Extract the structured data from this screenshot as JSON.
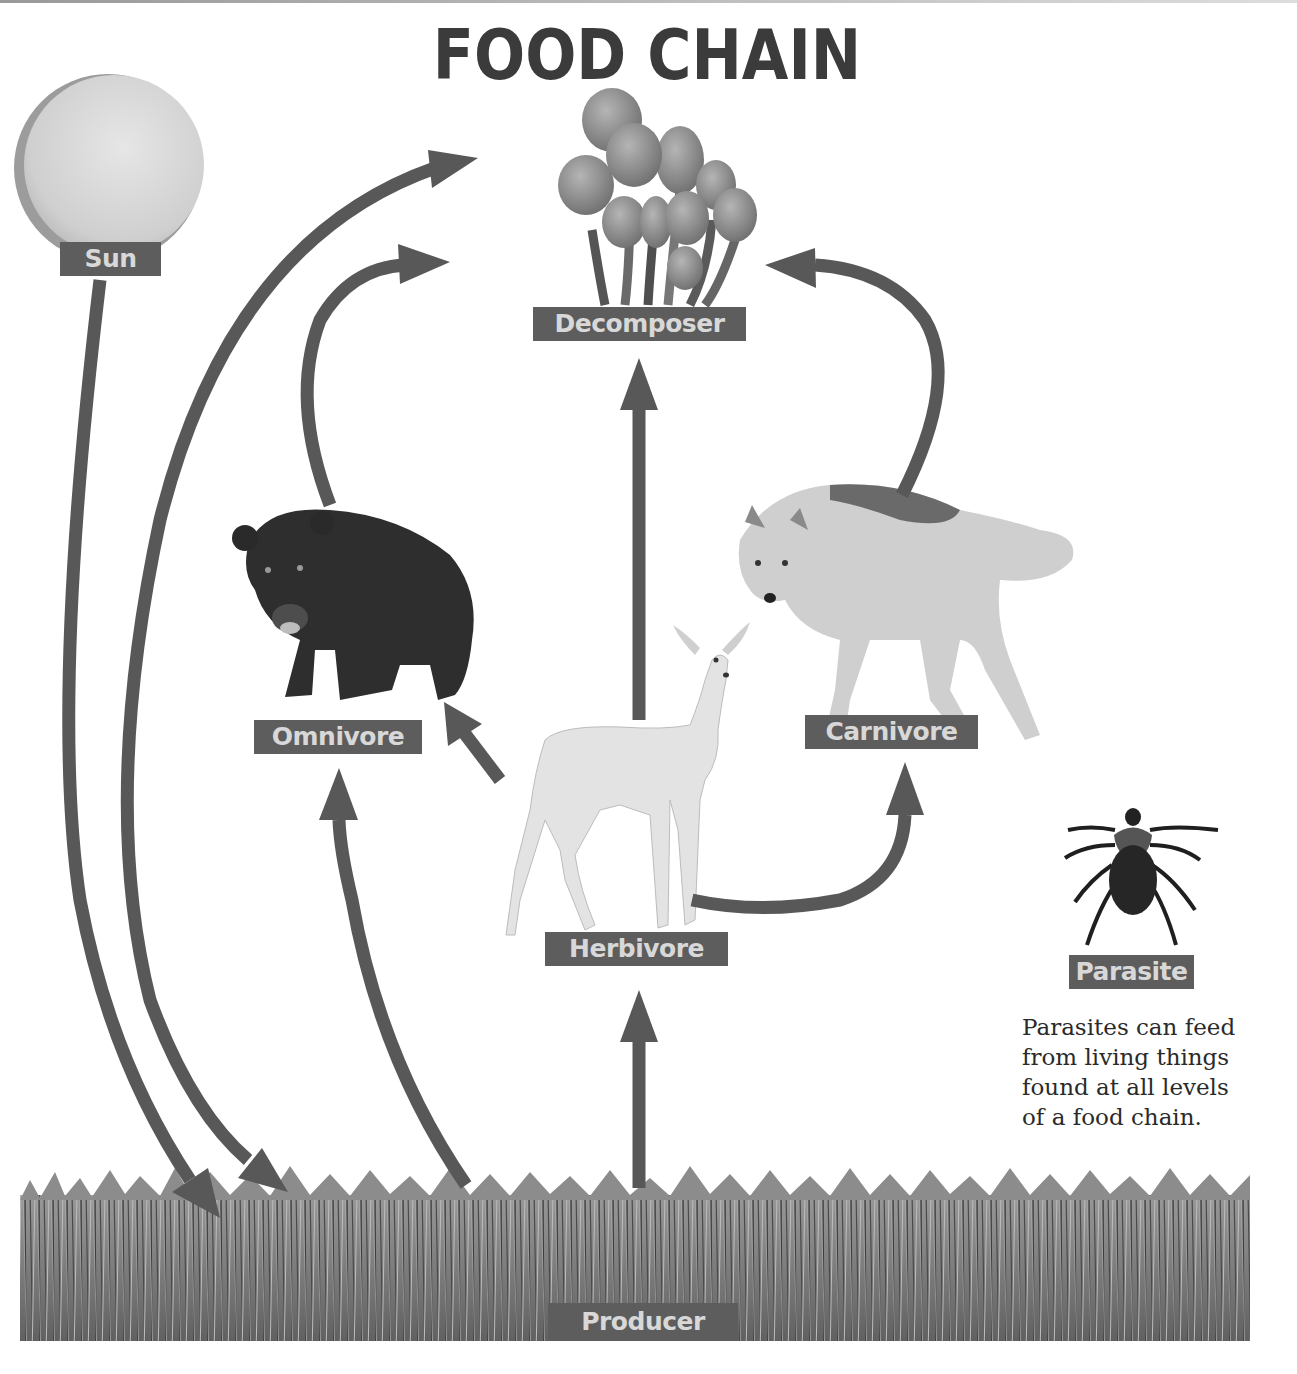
{
  "title": "FOOD CHAIN",
  "nodes": {
    "sun": {
      "label": "Sun",
      "icon": "sun-icon"
    },
    "decomposer": {
      "label": "Decomposer",
      "icon": "mushrooms-icon"
    },
    "omnivore": {
      "label": "Omnivore",
      "icon": "bear-icon"
    },
    "carnivore": {
      "label": "Carnivore",
      "icon": "wolf-icon"
    },
    "herbivore": {
      "label": "Herbivore",
      "icon": "deer-icon"
    },
    "parasite": {
      "label": "Parasite",
      "icon": "tick-icon"
    },
    "producer": {
      "label": "Producer",
      "icon": "grass-icon"
    }
  },
  "parasite_note": {
    "lines": [
      "Parasites can feed",
      "from living things",
      "found at all levels",
      "of a food chain."
    ]
  },
  "edges": [
    {
      "from": "Sun",
      "to": "Producer"
    },
    {
      "from": "Producer",
      "to": "Omnivore"
    },
    {
      "from": "Producer",
      "to": "Herbivore"
    },
    {
      "from": "Herbivore",
      "to": "Omnivore"
    },
    {
      "from": "Herbivore",
      "to": "Carnivore"
    },
    {
      "from": "Herbivore",
      "to": "Decomposer"
    },
    {
      "from": "Omnivore",
      "to": "Decomposer"
    },
    {
      "from": "Carnivore",
      "to": "Decomposer"
    },
    {
      "from": "Decomposer",
      "to": "Producer"
    }
  ],
  "colors": {
    "arrow": "#585858",
    "label_bg": "#5d5d5d",
    "label_text": "#d8d8d8",
    "title": "#3b3b3b"
  }
}
